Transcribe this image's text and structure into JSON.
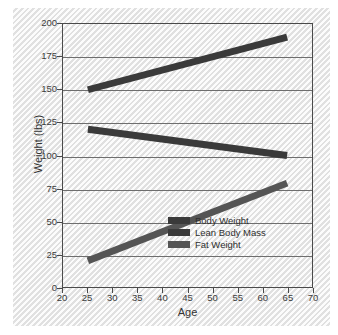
{
  "chart_data": {
    "type": "line",
    "title": "",
    "xlabel": "Age",
    "ylabel": "Weight (lbs)",
    "xlim": [
      20,
      70
    ],
    "ylim": [
      0,
      200
    ],
    "xticks": [
      20,
      25,
      30,
      35,
      40,
      45,
      50,
      55,
      60,
      65,
      70
    ],
    "yticks": [
      0,
      25,
      50,
      75,
      100,
      125,
      150,
      175,
      200
    ],
    "grid": "horizontal",
    "legend_position": "lower-right-inside",
    "x": [
      25,
      65
    ],
    "series": [
      {
        "name": "Body Weight",
        "values": [
          150,
          190
        ],
        "color": "#3a3a3a"
      },
      {
        "name": "Lean Body Mass",
        "values": [
          120,
          100
        ],
        "color": "#3a3a3a"
      },
      {
        "name": "Fat Weight",
        "values": [
          20,
          79
        ],
        "color": "#555555"
      }
    ]
  },
  "legend": {
    "items": [
      {
        "label": "Body Weight"
      },
      {
        "label": "Lean Body Mass"
      },
      {
        "label": "Fat Weight"
      }
    ]
  },
  "axes": {
    "x_title": "Age",
    "y_title": "Weight (lbs)",
    "x_tick_labels": [
      "20",
      "25",
      "30",
      "35",
      "40",
      "45",
      "50",
      "55",
      "60",
      "65",
      "70"
    ],
    "y_tick_labels": [
      "0",
      "25",
      "50",
      "75",
      "100",
      "125",
      "150",
      "175",
      "200"
    ]
  }
}
